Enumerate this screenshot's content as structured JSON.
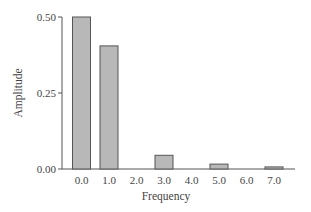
{
  "chart_data": {
    "type": "bar",
    "title": "",
    "xlabel": "Frequency",
    "ylabel": "Amplitude",
    "categories": [
      "0.0",
      "1.0",
      "2.0",
      "3.0",
      "4.0",
      "5.0",
      "6.0",
      "7.0"
    ],
    "values": [
      0.5,
      0.405,
      0.0,
      0.045,
      0.0,
      0.016,
      0.0,
      0.007
    ],
    "ylim": [
      0,
      0.5
    ],
    "yticks": [
      "0.00",
      "0.25",
      "0.50"
    ],
    "grid": false,
    "legend": null,
    "colors": {
      "bar_fill": "#b8b8b8",
      "bar_stroke": "#555555",
      "axis": "#555555"
    }
  }
}
